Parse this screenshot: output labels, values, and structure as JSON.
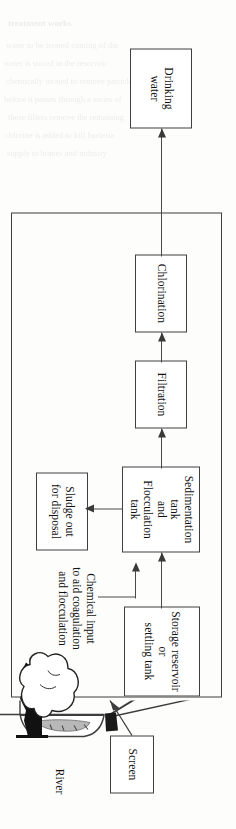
{
  "figure": {
    "type": "process-flow-diagram",
    "orientation": "rotated-90-clockwise",
    "page_background": "#fdfdfc",
    "line_color": "#3d3d3d"
  },
  "boxes": {
    "drinking_water": {
      "label": "Drinking\nwater"
    },
    "chlorination": {
      "label": "Chlorination"
    },
    "filtration": {
      "label": "Filtration"
    },
    "sedimentation": {
      "label": "Sedimentation tank\nand\nFlocculation tank"
    },
    "storage": {
      "label": "Storage reservoir\nor\nsettling tank"
    },
    "sludge": {
      "label": "Sludge out\nfor disposal"
    },
    "screen": {
      "label": "Screen"
    }
  },
  "captions": {
    "chemical_input": "Chemical input\nto aid coagulation\nand flocculation",
    "river": "River"
  },
  "flow_sequence": [
    "River",
    "Screen",
    "Storage reservoir or settling tank",
    "Sedimentation tank and Flocculation tank",
    "Filtration",
    "Chlorination",
    "Drinking water"
  ],
  "branches": [
    {
      "from": "Sedimentation tank and Flocculation tank",
      "to": "Sludge out for disposal"
    },
    {
      "from": "Chemical input to aid coagulation and flocculation",
      "to": "Storage reservoir or settling tank outlet"
    }
  ],
  "bleed_through_lines": [
    "treatment works",
    "water to be treated coming of the",
    "water is stored in the reservoir",
    "chemically treated to remove particles,",
    "before it passes through a series of",
    "these filters remove the remaining",
    "chlorine is added to kill bacteria",
    "supply to homes and industry"
  ]
}
